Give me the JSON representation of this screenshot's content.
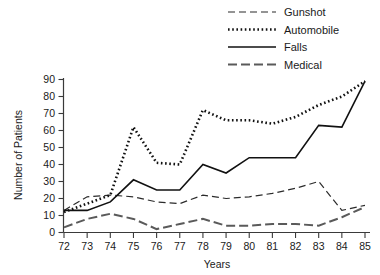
{
  "chart_data": {
    "type": "line",
    "title": "",
    "xlabel": "Years",
    "ylabel": "Number of Patients",
    "categories": [
      "72",
      "73",
      "74",
      "75",
      "76",
      "77",
      "78",
      "79",
      "80",
      "81",
      "82",
      "83",
      "84",
      "85"
    ],
    "x": [
      72,
      73,
      74,
      75,
      76,
      77,
      78,
      79,
      80,
      81,
      82,
      83,
      84,
      85
    ],
    "xlim": [
      72,
      85
    ],
    "ylim": [
      0,
      90
    ],
    "yticks": [
      0,
      10,
      20,
      30,
      40,
      50,
      60,
      70,
      80,
      90
    ],
    "xticks": [
      72,
      73,
      74,
      75,
      76,
      77,
      78,
      79,
      80,
      81,
      82,
      83,
      84,
      85
    ],
    "grid": false,
    "legend_position": "top-right",
    "series": [
      {
        "name": "Gunshot",
        "style": "dashed",
        "color": "#2b2b2b",
        "values": [
          13,
          21,
          22,
          21,
          18,
          17,
          22,
          20,
          21,
          23,
          26,
          30,
          13,
          16
        ]
      },
      {
        "name": "Automobile",
        "style": "dotted",
        "color": "#111111",
        "values": [
          12,
          17,
          22,
          62,
          41,
          40,
          72,
          66,
          66,
          64,
          68,
          75,
          80,
          89
        ]
      },
      {
        "name": "Falls",
        "style": "solid",
        "color": "#111111",
        "values": [
          13,
          13,
          18,
          31,
          25,
          25,
          40,
          35,
          44,
          44,
          44,
          63,
          62,
          89
        ]
      },
      {
        "name": "Medical",
        "style": "dashdot",
        "color": "#5a5a5a",
        "values": [
          3,
          8,
          11,
          8,
          2,
          5,
          8,
          4,
          4,
          5,
          5,
          4,
          9,
          15
        ]
      }
    ]
  },
  "legend": {
    "items": [
      {
        "label": "Gunshot"
      },
      {
        "label": "Automobile"
      },
      {
        "label": "Falls"
      },
      {
        "label": "Medical"
      }
    ]
  },
  "axes": {
    "y_title": "Number of Patients",
    "x_title": "Years"
  }
}
